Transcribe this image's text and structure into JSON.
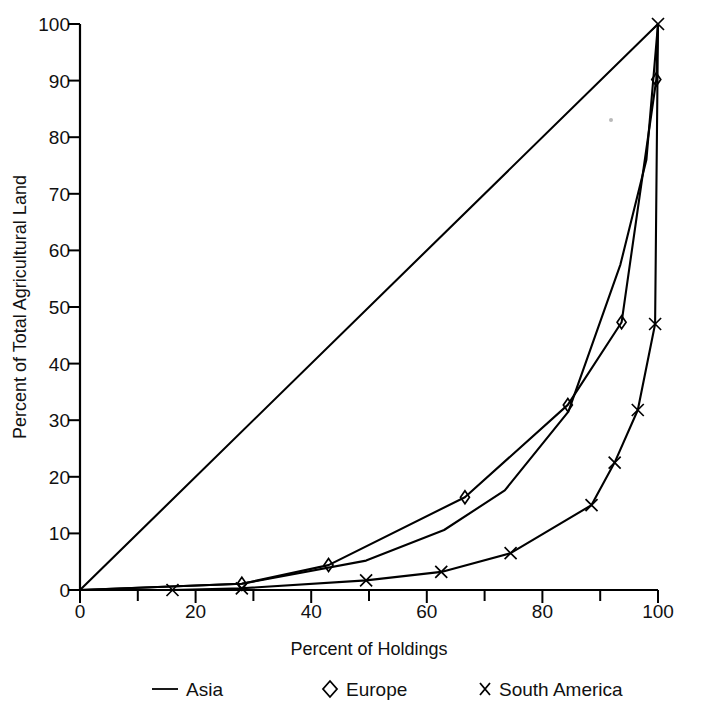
{
  "chart_data": {
    "type": "line",
    "title": "",
    "xlabel": "Percent of Holdings",
    "ylabel": "Percent of Total Agricultural Land",
    "xlim": [
      0,
      100
    ],
    "ylim": [
      0,
      100
    ],
    "xticks": [
      0,
      20,
      40,
      60,
      80,
      100
    ],
    "yticks": [
      0,
      10,
      20,
      30,
      40,
      50,
      60,
      70,
      80,
      90,
      100
    ],
    "xtick_labels": [
      "0",
      "20",
      "40",
      "60",
      "80",
      "100"
    ],
    "ytick_labels": [
      "0",
      "10",
      "20",
      "30",
      "40",
      "50",
      "60",
      "70",
      "80",
      "90",
      "100"
    ],
    "xminor_step": 10,
    "grid": false,
    "legend_position": "bottom",
    "series": [
      {
        "name": "Asia",
        "marker": "none",
        "legend_symbol": "line",
        "x": [
          0,
          28,
          49.5,
          63,
          73.5,
          84.5,
          93.5,
          98,
          100
        ],
        "y": [
          0,
          1.1,
          5.2,
          10.6,
          17.6,
          31.5,
          57.5,
          76.0,
          100
        ]
      },
      {
        "name": "Europe",
        "marker": "diamond",
        "legend_symbol": "diamond",
        "x": [
          0,
          28,
          43,
          66.6,
          84.4,
          93.7,
          99.7,
          100
        ],
        "y": [
          0,
          1.1,
          4.4,
          16.4,
          32.7,
          47.3,
          90.2,
          100
        ]
      },
      {
        "name": "South America",
        "marker": "x",
        "legend_symbol": "x",
        "x": [
          0,
          16,
          28,
          49.5,
          62.5,
          74.5,
          88.5,
          92.5,
          96.5,
          99.5,
          100
        ],
        "y": [
          0,
          0.0,
          0.3,
          1.7,
          3.2,
          6.5,
          15.0,
          22.5,
          31.8,
          47.0,
          100
        ]
      },
      {
        "name": "equality-line",
        "marker": "none",
        "legend_symbol": "none",
        "x": [
          0,
          100
        ],
        "y": [
          0,
          100
        ]
      }
    ],
    "legend": [
      {
        "label": "Asia",
        "symbol": "line"
      },
      {
        "label": "Europe",
        "symbol": "diamond"
      },
      {
        "label": "South America",
        "symbol": "x"
      }
    ]
  }
}
